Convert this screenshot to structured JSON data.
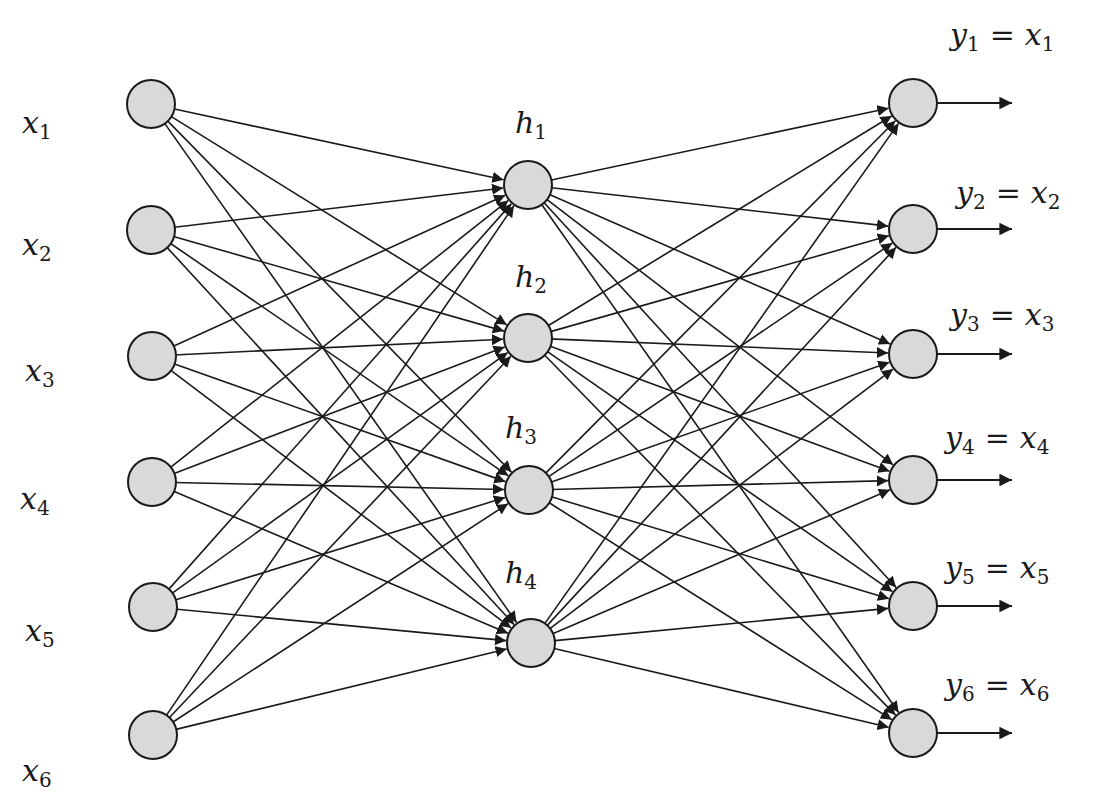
{
  "diagram": {
    "type": "autoencoder-neural-network",
    "colors": {
      "node_fill": "#d9d9d9",
      "stroke": "#1a1a1a",
      "background": "#ffffff"
    },
    "layers": {
      "input": [
        {
          "id": "x1",
          "var": "x",
          "sub": "1",
          "cx": 151,
          "cy": 104,
          "lx": 22,
          "ly": 108
        },
        {
          "id": "x2",
          "var": "x",
          "sub": "2",
          "cx": 151,
          "cy": 230,
          "lx": 22,
          "ly": 230
        },
        {
          "id": "x3",
          "var": "x",
          "sub": "3",
          "cx": 152,
          "cy": 356,
          "lx": 25,
          "ly": 356
        },
        {
          "id": "x4",
          "var": "x",
          "sub": "4",
          "cx": 152,
          "cy": 482,
          "lx": 20,
          "ly": 484
        },
        {
          "id": "x5",
          "var": "x",
          "sub": "5",
          "cx": 153,
          "cy": 607,
          "lx": 25,
          "ly": 616
        },
        {
          "id": "x6",
          "var": "x",
          "sub": "6",
          "cx": 153,
          "cy": 735,
          "lx": 22,
          "ly": 756
        }
      ],
      "hidden": [
        {
          "id": "h1",
          "var": "h",
          "sub": "1",
          "cx": 528,
          "cy": 185,
          "lx": 515,
          "ly": 108
        },
        {
          "id": "h2",
          "var": "h",
          "sub": "2",
          "cx": 528,
          "cy": 338,
          "lx": 515,
          "ly": 262
        },
        {
          "id": "h3",
          "var": "h",
          "sub": "3",
          "cx": 529,
          "cy": 490,
          "lx": 505,
          "ly": 413
        },
        {
          "id": "h4",
          "var": "h",
          "sub": "4",
          "cx": 531,
          "cy": 643,
          "lx": 505,
          "ly": 558
        }
      ],
      "output": [
        {
          "id": "y1",
          "var": "y",
          "sub": "1",
          "rhs_var": "x",
          "rhs_sub": "1",
          "cx": 913,
          "cy": 103,
          "lx": 950,
          "ly": 20
        },
        {
          "id": "y2",
          "var": "y",
          "sub": "2",
          "rhs_var": "x",
          "rhs_sub": "2",
          "cx": 913,
          "cy": 229,
          "lx": 956,
          "ly": 178
        },
        {
          "id": "y3",
          "var": "y",
          "sub": "3",
          "rhs_var": "x",
          "rhs_sub": "3",
          "cx": 913,
          "cy": 354,
          "lx": 950,
          "ly": 300
        },
        {
          "id": "y4",
          "var": "y",
          "sub": "4",
          "rhs_var": "x",
          "rhs_sub": "4",
          "cx": 913,
          "cy": 480,
          "lx": 945,
          "ly": 423
        },
        {
          "id": "y5",
          "var": "y",
          "sub": "5",
          "rhs_var": "x",
          "rhs_sub": "5",
          "cx": 913,
          "cy": 606,
          "lx": 945,
          "ly": 553
        },
        {
          "id": "y6",
          "var": "y",
          "sub": "6",
          "rhs_var": "x",
          "rhs_sub": "6",
          "cx": 913,
          "cy": 733,
          "lx": 945,
          "ly": 670
        }
      ]
    },
    "node_radius": 24,
    "output_arrow_length": 75,
    "connectivity": "fully-connected input→hidden and hidden→output"
  }
}
